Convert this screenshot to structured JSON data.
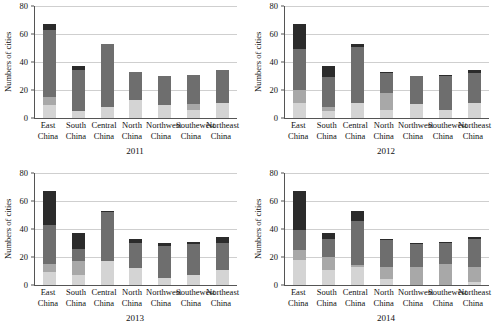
{
  "chart_data": [
    {
      "type": "bar",
      "title": "2011",
      "xlabel": "",
      "ylabel": "Numbers of cities",
      "ylim": [
        0,
        80
      ],
      "yticks": [
        0,
        20,
        40,
        60,
        80
      ],
      "grid": true,
      "stacked": true,
      "legend": "none",
      "categories": [
        "East China",
        "South China",
        "Central China",
        "North China",
        "Northwest China",
        "Southewest China",
        "Northeast China"
      ],
      "series": [
        {
          "name": "segment-1",
          "color": "#d4d4d4",
          "values": [
            9,
            5,
            8,
            13,
            9,
            6,
            11
          ]
        },
        {
          "name": "segment-2",
          "color": "#a8a8a8",
          "values": [
            6,
            0,
            0,
            0,
            0,
            4,
            0
          ]
        },
        {
          "name": "segment-3",
          "color": "#6e6e6e",
          "values": [
            48,
            29,
            45,
            20,
            21,
            21,
            23
          ]
        },
        {
          "name": "segment-4",
          "color": "#2b2b2b",
          "values": [
            4,
            3,
            0,
            0,
            0,
            0,
            0
          ]
        }
      ],
      "totals": [
        67,
        37,
        53,
        33,
        30,
        31,
        34
      ]
    },
    {
      "type": "bar",
      "title": "2012",
      "xlabel": "",
      "ylabel": "Numbers of cities",
      "ylim": [
        0,
        80
      ],
      "yticks": [
        0,
        20,
        40,
        60,
        80
      ],
      "grid": true,
      "stacked": true,
      "legend": "none",
      "categories": [
        "East China",
        "South China",
        "Central China",
        "North China",
        "Northwest China",
        "Southewest China",
        "Northeast China"
      ],
      "series": [
        {
          "name": "segment-1",
          "color": "#d4d4d4",
          "values": [
            11,
            5,
            11,
            6,
            10,
            6,
            11
          ]
        },
        {
          "name": "segment-2",
          "color": "#a8a8a8",
          "values": [
            9,
            3,
            0,
            12,
            0,
            0,
            0
          ]
        },
        {
          "name": "segment-3",
          "color": "#6e6e6e",
          "values": [
            29,
            21,
            40,
            14,
            20,
            24,
            21
          ]
        },
        {
          "name": "segment-4",
          "color": "#2b2b2b",
          "values": [
            18,
            8,
            2,
            1,
            0,
            1,
            2
          ]
        }
      ],
      "totals": [
        67,
        37,
        53,
        33,
        30,
        31,
        34
      ]
    },
    {
      "type": "bar",
      "title": "2013",
      "xlabel": "",
      "ylabel": "Numbers of cities",
      "ylim": [
        0,
        80
      ],
      "yticks": [
        0,
        20,
        40,
        60,
        80
      ],
      "grid": true,
      "stacked": true,
      "legend": "none",
      "categories": [
        "East China",
        "South China",
        "Central China",
        "North China",
        "Northwest China",
        "Southewest China",
        "Northeast China"
      ],
      "series": [
        {
          "name": "segment-1",
          "color": "#d4d4d4",
          "values": [
            9,
            7,
            17,
            12,
            5,
            7,
            11
          ]
        },
        {
          "name": "segment-2",
          "color": "#a8a8a8",
          "values": [
            6,
            10,
            0,
            0,
            0,
            0,
            0
          ]
        },
        {
          "name": "segment-3",
          "color": "#6e6e6e",
          "values": [
            28,
            9,
            35,
            18,
            23,
            22,
            19
          ]
        },
        {
          "name": "segment-4",
          "color": "#2b2b2b",
          "values": [
            24,
            11,
            1,
            3,
            2,
            2,
            4
          ]
        }
      ],
      "totals": [
        67,
        37,
        53,
        33,
        30,
        31,
        34
      ]
    },
    {
      "type": "bar",
      "title": "2014",
      "xlabel": "",
      "ylabel": "Numbers of cities",
      "ylim": [
        0,
        80
      ],
      "yticks": [
        0,
        20,
        40,
        60,
        80
      ],
      "grid": true,
      "stacked": true,
      "legend": "none",
      "categories": [
        "East China",
        "South China",
        "Central China",
        "North China",
        "Northwest China",
        "Southewest China",
        "Northeast China"
      ],
      "series": [
        {
          "name": "segment-1",
          "color": "#d4d4d4",
          "values": [
            18,
            11,
            13,
            4,
            0,
            0,
            2
          ]
        },
        {
          "name": "segment-2",
          "color": "#a8a8a8",
          "values": [
            7,
            9,
            1,
            9,
            13,
            15,
            11
          ]
        },
        {
          "name": "segment-3",
          "color": "#6e6e6e",
          "values": [
            14,
            13,
            32,
            19,
            16,
            15,
            20
          ]
        },
        {
          "name": "segment-4",
          "color": "#2b2b2b",
          "values": [
            28,
            4,
            7,
            1,
            1,
            1,
            1
          ]
        }
      ],
      "totals": [
        67,
        37,
        53,
        33,
        30,
        31,
        34
      ]
    }
  ]
}
